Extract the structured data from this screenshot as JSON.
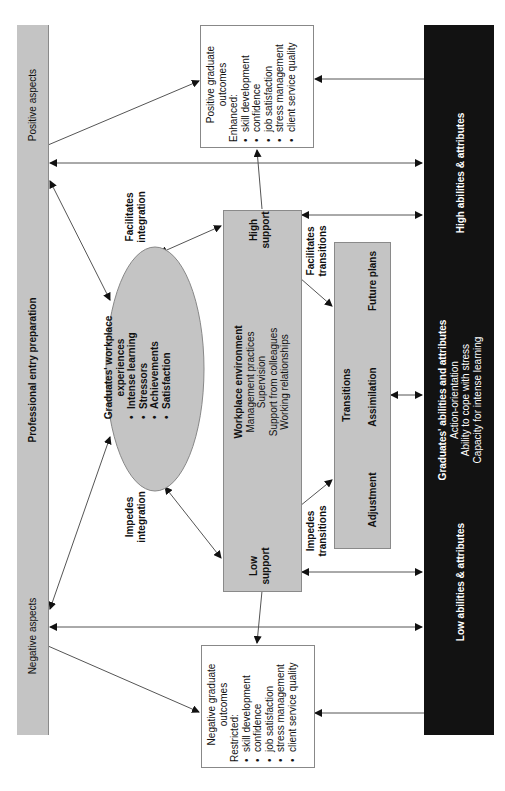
{
  "left_bar": {
    "top_label": "Positive aspects",
    "middle_label": "Professional entry preparation",
    "bottom_label": "Negative aspects",
    "color": "#c4c4c4"
  },
  "right_bar": {
    "top_label": "High abilities & attributes",
    "middle_title": "Graduates' abilities and attributes",
    "middle_items": [
      "Action-orientation",
      "Ability to cope with stress",
      "Capacity for intense learning"
    ],
    "bottom_label": "Low abilities & attributes",
    "color": "#121212"
  },
  "positive_outcomes": {
    "title_line1": "Positive graduate",
    "title_line2": "outcomes",
    "subtitle": "Enhanced:",
    "items": [
      "skill development",
      "confidence",
      "job satisfaction",
      "stress management",
      "client service quality"
    ]
  },
  "negative_outcomes": {
    "title_line1": "Negative graduate",
    "title_line2": "outcomes",
    "subtitle": "Restricted:",
    "items": [
      "skill development",
      "confidence",
      "job satisfaction",
      "stress management",
      "client service quality"
    ]
  },
  "experiences": {
    "title_line1": "Graduates' workplace",
    "title_line2": "experiences",
    "items": [
      "Intense learning",
      "Stressors",
      "Achievements",
      "Satisfaction"
    ]
  },
  "integration_labels": {
    "facilitates_line1": "Facilitates",
    "facilitates_line2": "integration",
    "impedes_line1": "Impedes",
    "impedes_line2": "integration"
  },
  "workplace": {
    "title": "Workplace environment",
    "items": [
      "Management practices",
      "Supervision",
      "Support from colleagues",
      "Working relationships"
    ],
    "high_line1": "High",
    "high_line2": "support",
    "low_line1": "Low",
    "low_line2": "support"
  },
  "transition_labels": {
    "facilitates_line1": "Facilitates",
    "facilitates_line2": "transitions",
    "impedes_line1": "Impedes",
    "impedes_line2": "transitions"
  },
  "transitions": {
    "title": "Transitions",
    "stages": [
      "Adjustment",
      "Assimilation",
      "Future plans"
    ]
  }
}
